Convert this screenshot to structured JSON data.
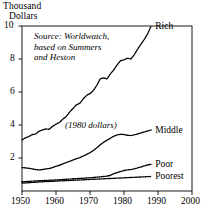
{
  "axis_title": {
    "line1": "Thousand",
    "line2": "Dollars"
  },
  "annotations": {
    "source": "Source: Worldwatch,\nbased on Summers\nand Heston",
    "units": "(1980 dollars)"
  },
  "chart_data": {
    "type": "line",
    "title": "",
    "subtitle": "",
    "xlabel": "",
    "ylabel": "Thousand Dollars",
    "xlim": [
      1950,
      2000
    ],
    "ylim": [
      0,
      10
    ],
    "xticks": [
      1950,
      1960,
      1970,
      1980,
      1990,
      2000
    ],
    "xtick_labels": [
      "1950",
      "1960",
      "1970",
      "1980",
      "1990",
      "2000"
    ],
    "yticks": [
      2,
      4,
      6,
      8,
      10
    ],
    "ytick_labels": [
      "2",
      "4",
      "6",
      "8",
      "10"
    ],
    "grid": false,
    "legend_position": "right-inline-labels",
    "line_style": "dotted",
    "line_color": "#000000",
    "series": [
      {
        "name": "Rich",
        "label": "Rich",
        "x": [
          1950,
          1951,
          1952,
          1953,
          1954,
          1955,
          1956,
          1957,
          1958,
          1959,
          1960,
          1961,
          1962,
          1963,
          1964,
          1965,
          1966,
          1967,
          1968,
          1969,
          1970,
          1971,
          1972,
          1973,
          1974,
          1975,
          1976,
          1977,
          1978,
          1979,
          1980,
          1981,
          1982,
          1983,
          1984,
          1985,
          1986,
          1987,
          1988
        ],
        "values": [
          3.1,
          3.22,
          3.3,
          3.42,
          3.45,
          3.62,
          3.7,
          3.76,
          3.74,
          3.92,
          4.05,
          4.15,
          4.35,
          4.52,
          4.78,
          5.0,
          5.22,
          5.32,
          5.58,
          5.8,
          5.9,
          6.1,
          6.4,
          6.8,
          6.85,
          6.8,
          7.1,
          7.35,
          7.65,
          7.9,
          7.95,
          8.05,
          8.0,
          8.25,
          8.6,
          8.9,
          9.2,
          9.55,
          10.0
        ]
      },
      {
        "name": "Middle",
        "label": "Middle",
        "x": [
          1950,
          1951,
          1952,
          1953,
          1954,
          1955,
          1956,
          1957,
          1958,
          1959,
          1960,
          1961,
          1962,
          1963,
          1964,
          1965,
          1966,
          1967,
          1968,
          1969,
          1970,
          1971,
          1972,
          1973,
          1974,
          1975,
          1976,
          1977,
          1978,
          1979,
          1980,
          1981,
          1982,
          1983,
          1984,
          1985,
          1986,
          1987,
          1988
        ],
        "values": [
          1.42,
          1.4,
          1.38,
          1.34,
          1.3,
          1.28,
          1.3,
          1.34,
          1.36,
          1.42,
          1.5,
          1.56,
          1.64,
          1.72,
          1.8,
          1.88,
          1.96,
          2.02,
          2.12,
          2.22,
          2.32,
          2.46,
          2.62,
          2.8,
          2.95,
          3.08,
          3.2,
          3.32,
          3.4,
          3.44,
          3.42,
          3.38,
          3.36,
          3.4,
          3.46,
          3.52,
          3.58,
          3.64,
          3.7
        ]
      },
      {
        "name": "Poor",
        "label": "Poor",
        "x": [
          1950,
          1951,
          1952,
          1953,
          1954,
          1955,
          1956,
          1957,
          1958,
          1959,
          1960,
          1961,
          1962,
          1963,
          1964,
          1965,
          1966,
          1967,
          1968,
          1969,
          1970,
          1971,
          1972,
          1973,
          1974,
          1975,
          1976,
          1977,
          1978,
          1979,
          1980,
          1981,
          1982,
          1983,
          1984,
          1985,
          1986,
          1987,
          1988
        ],
        "values": [
          0.56,
          0.57,
          0.58,
          0.6,
          0.61,
          0.62,
          0.63,
          0.64,
          0.65,
          0.66,
          0.67,
          0.68,
          0.7,
          0.71,
          0.72,
          0.74,
          0.75,
          0.76,
          0.78,
          0.79,
          0.8,
          0.82,
          0.84,
          0.86,
          0.88,
          0.9,
          0.95,
          1.05,
          1.12,
          1.18,
          1.24,
          1.28,
          1.3,
          1.34,
          1.4,
          1.46,
          1.52,
          1.58,
          1.62
        ]
      },
      {
        "name": "Poorest",
        "label": "Poorest",
        "x": [
          1950,
          1951,
          1952,
          1953,
          1954,
          1955,
          1956,
          1957,
          1958,
          1959,
          1960,
          1961,
          1962,
          1963,
          1964,
          1965,
          1966,
          1967,
          1968,
          1969,
          1970,
          1971,
          1972,
          1973,
          1974,
          1975,
          1976,
          1977,
          1978,
          1979,
          1980,
          1981,
          1982,
          1983,
          1984,
          1985,
          1986,
          1987,
          1988
        ],
        "values": [
          0.48,
          0.49,
          0.5,
          0.52,
          0.53,
          0.55,
          0.56,
          0.57,
          0.58,
          0.59,
          0.6,
          0.61,
          0.62,
          0.63,
          0.64,
          0.65,
          0.66,
          0.67,
          0.68,
          0.69,
          0.7,
          0.71,
          0.72,
          0.73,
          0.74,
          0.75,
          0.76,
          0.77,
          0.78,
          0.79,
          0.8,
          0.81,
          0.82,
          0.83,
          0.84,
          0.85,
          0.86,
          0.87,
          0.88
        ]
      }
    ]
  },
  "colors": {
    "ink": "#000000",
    "background": "#ffffff"
  }
}
